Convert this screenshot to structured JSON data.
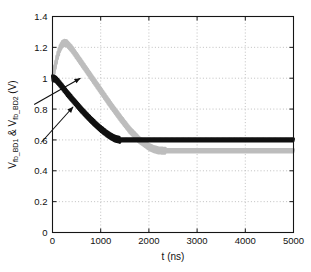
{
  "chart_data": {
    "type": "line",
    "title": "",
    "xlabel": "t (ns)",
    "ylabel": "V_fb_BD1 & V_fb_BD2 (V)",
    "ylabel_parts": {
      "v1_main": "V",
      "v1_sub": "fb_BD1",
      "amp": " & ",
      "v2_main": "V",
      "v2_sub": "fb_BD2",
      "unit": " (V)"
    },
    "xlim": [
      0,
      5000
    ],
    "ylim": [
      0,
      1.4
    ],
    "xticks": [
      0,
      1000,
      2000,
      3000,
      4000,
      5000
    ],
    "yticks": [
      0,
      0.2,
      0.4,
      0.6,
      0.8,
      1,
      1.2,
      1.4
    ],
    "xticklabels": [
      "0",
      "1000",
      "2000",
      "3000",
      "4000",
      "5000"
    ],
    "yticklabels": [
      "0",
      "0.2",
      "0.4",
      "0.6",
      "0.8",
      "1",
      "1.2",
      "1.4"
    ],
    "grid": true,
    "grid_style": "dotted",
    "grid_color": "#b9b9b9",
    "legend": "none",
    "axis_color": "#1a1a1a",
    "background": "#ffffff",
    "series": [
      {
        "name": "V_fb_BD1",
        "color": "#101010",
        "style": "ripple-line",
        "description": "Starts at 1.0 V, decays nearly linearly, settles at 0.6 V near 1400 ns",
        "settle_value": 0.6,
        "settle_time": 1400,
        "start_value": 1.0,
        "x": [
          0,
          60,
          120,
          200,
          300,
          400,
          500,
          600,
          700,
          800,
          900,
          1000,
          1100,
          1200,
          1300,
          1400,
          1500,
          1800,
          2200,
          2600,
          3000,
          3500,
          4000,
          4500,
          5000
        ],
        "values": [
          1.0,
          0.995,
          0.975,
          0.945,
          0.905,
          0.868,
          0.832,
          0.796,
          0.762,
          0.73,
          0.7,
          0.672,
          0.647,
          0.625,
          0.608,
          0.6,
          0.6,
          0.6,
          0.6,
          0.6,
          0.6,
          0.6,
          0.6,
          0.6,
          0.6
        ]
      },
      {
        "name": "V_fb_BD2",
        "color": "#bdbdbd",
        "style": "ripple-line",
        "description": "Starts at 1.0 V, overshoots to peak 1.23 V near 250 ns, then decays and settles at 0.53 V near 2350 ns",
        "peak_value": 1.23,
        "peak_time": 250,
        "settle_value": 0.53,
        "settle_time": 2350,
        "start_value": 1.0,
        "x": [
          0,
          50,
          100,
          150,
          200,
          250,
          300,
          400,
          500,
          600,
          700,
          800,
          900,
          1000,
          1200,
          1400,
          1600,
          1800,
          2000,
          2100,
          2200,
          2300,
          2350,
          2500,
          3000,
          3500,
          4000,
          4500,
          5000
        ],
        "values": [
          1.0,
          1.07,
          1.14,
          1.19,
          1.22,
          1.23,
          1.225,
          1.19,
          1.145,
          1.1,
          1.055,
          1.01,
          0.965,
          0.92,
          0.83,
          0.745,
          0.665,
          0.6,
          0.556,
          0.54,
          0.532,
          0.53,
          0.53,
          0.53,
          0.53,
          0.53,
          0.53,
          0.53,
          0.53
        ]
      }
    ],
    "annotations": [
      {
        "name": "arrow-to-bd2",
        "target_series": "V_fb_BD2",
        "from": [
          -380,
          0.83
        ],
        "to": [
          580,
          1.0
        ]
      },
      {
        "name": "arrow-to-bd1",
        "target_series": "V_fb_BD1",
        "from": [
          -230,
          0.585
        ],
        "to": [
          430,
          0.815
        ]
      }
    ]
  }
}
